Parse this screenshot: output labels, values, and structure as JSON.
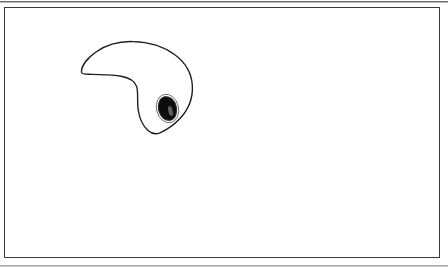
{
  "figure": {
    "title": "",
    "caption": "",
    "background_color": "#ffffff",
    "frame": {
      "name": "figure-frame",
      "stroke_color": "#3a3a3a",
      "stroke_width": 1,
      "x": 4,
      "y": 7,
      "width": 436,
      "height": 251,
      "fill": "#ffffff"
    },
    "artifacts": [
      {
        "name": "scan-edge-top",
        "y": 1,
        "color": "#6d6d6d"
      },
      {
        "name": "scan-edge-top-soft",
        "y": 2,
        "color": "#b9b9b9"
      },
      {
        "name": "scan-edge-bottom",
        "y": 265,
        "color": "#a8a8a8"
      },
      {
        "name": "scan-edge-bottom-soft",
        "y": 266,
        "color": "#cfcfcf"
      }
    ],
    "drawing": {
      "type": "line-drawing",
      "subject": "comma-shaped cell outline with nucleus",
      "stroke_color": "#1f1f1f",
      "stroke_width": 1.4,
      "fill": "#ffffff",
      "bounds": {
        "x": 80,
        "y": 41,
        "width": 113,
        "height": 94
      },
      "body_outline_path": "M 81.5 72.6 C 81.0 66.0 87.5 58.0 96.0 52.0 C 106.5 44.6 120.0 41.2 133.0 41.6 C 148.0 42.0 163.0 46.0 174.5 54.5 C 185.0 62.2 191.5 73.0 192.3 85.0 C 193.2 98.0 188.0 110.0 180.0 118.5 C 173.5 125.4 166.0 130.2 160.0 132.8 C 156.0 134.6 151.5 133.6 148.0 130.5 C 143.0 126.0 139.6 118.6 138.3 110.5 C 136.8 101.0 138.6 92.4 136.6 86.4 C 134.6 80.4 129.0 77.6 121.0 76.2 C 111.5 74.6 100.5 74.8 92.0 74.4 C 86.5 74.1 82.0 74.4 81.5 72.6 Z",
      "nucleus": {
        "name": "nucleus",
        "shape": "ellipse",
        "cx": 167.5,
        "cy": 108.5,
        "rx": 9.0,
        "ry": 12.0,
        "rotation_deg": -14,
        "fill": "#0d0d0d",
        "stroke_color": "#2a2a2a",
        "halo_rx": 11.0,
        "halo_ry": 14.5,
        "halo_stroke": "#5a5a5a",
        "highlight": {
          "cx": 170.5,
          "cy": 111.0,
          "rx": 2.2,
          "ry": 5.0,
          "rotation_deg": -14,
          "fill": "#6e6e6e"
        }
      },
      "tail_tip": {
        "x": 81,
        "y": 72
      },
      "head_extent": {
        "x": 192,
        "y": 85
      },
      "bottom_tip": {
        "x": 158,
        "y": 133
      }
    }
  }
}
